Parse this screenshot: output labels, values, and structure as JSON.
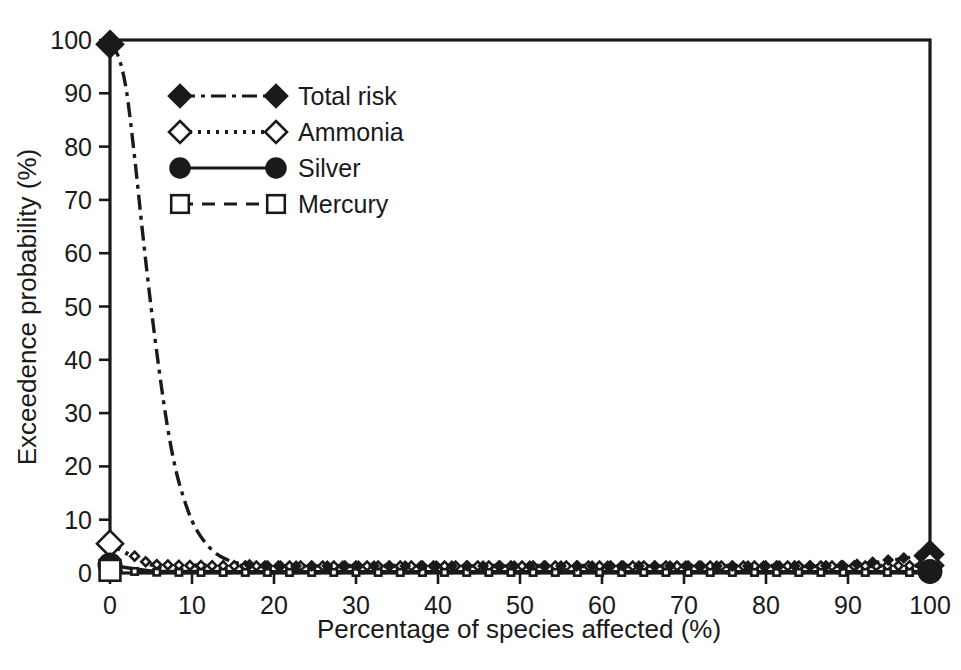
{
  "chart_data": {
    "type": "line",
    "title": "",
    "xlabel": "Percentage of species affected (%)",
    "ylabel": "Exceedence probability (%)",
    "xlim": [
      0,
      100
    ],
    "ylim": [
      0,
      100
    ],
    "xticks": [
      0,
      10,
      20,
      30,
      40,
      50,
      60,
      70,
      80,
      90,
      100
    ],
    "yticks": [
      0,
      10,
      20,
      30,
      40,
      50,
      60,
      70,
      80,
      90,
      100
    ],
    "xtick_labels": [
      "0",
      "10",
      "20",
      "30",
      "40",
      "50",
      "60",
      "70",
      "80",
      "90",
      "100"
    ],
    "ytick_labels": [
      "0",
      "10",
      "20",
      "30",
      "40",
      "50",
      "60",
      "70",
      "80",
      "90",
      "100"
    ],
    "grid": false,
    "legend_position": "upper-left-inside",
    "frame": "box",
    "series": [
      {
        "name": "Total risk",
        "marker": "filled-diamond",
        "linestyle": "dash-dot",
        "color": "#1a1a1a",
        "x": [
          0,
          1,
          2,
          3,
          4,
          5,
          6,
          7,
          8,
          9,
          10,
          11,
          12,
          13,
          14,
          15,
          16,
          18,
          20,
          25,
          30,
          40,
          50,
          60,
          70,
          80,
          90,
          100
        ],
        "y": [
          99.2,
          97.0,
          90.5,
          78.0,
          63.5,
          50.0,
          38.0,
          27.5,
          19.5,
          14.0,
          9.8,
          7.0,
          5.0,
          3.6,
          2.7,
          2.1,
          1.7,
          1.4,
          1.3,
          1.3,
          1.3,
          1.3,
          1.3,
          1.3,
          1.3,
          1.3,
          1.4,
          3.5
        ],
        "markers_at": [
          0,
          100
        ]
      },
      {
        "name": "Ammonia",
        "marker": "open-diamond",
        "linestyle": "dotted",
        "color": "#1a1a1a",
        "x": [
          0,
          5,
          10,
          20,
          30,
          40,
          50,
          60,
          70,
          80,
          90,
          100
        ],
        "y": [
          5.5,
          1.6,
          1.4,
          1.3,
          1.3,
          1.3,
          1.3,
          1.3,
          1.3,
          1.3,
          1.3,
          1.4
        ],
        "markers_at": [
          0,
          100
        ]
      },
      {
        "name": "Silver",
        "marker": "filled-circle",
        "linestyle": "solid",
        "color": "#1a1a1a",
        "x": [
          0,
          5,
          10,
          20,
          30,
          40,
          50,
          60,
          70,
          80,
          90,
          100
        ],
        "y": [
          1.5,
          0.4,
          0.3,
          0.25,
          0.25,
          0.25,
          0.25,
          0.25,
          0.25,
          0.25,
          0.25,
          0.3
        ],
        "markers_at": [
          0,
          100
        ]
      },
      {
        "name": "Mercury",
        "marker": "open-square",
        "linestyle": "dashed",
        "color": "#1a1a1a",
        "x": [
          0,
          5,
          10,
          20,
          30,
          40,
          50,
          60,
          70,
          80,
          90,
          100
        ],
        "y": [
          0.5,
          0.15,
          0.1,
          0.1,
          0.1,
          0.1,
          0.1,
          0.1,
          0.1,
          0.1,
          0.1,
          0.1
        ],
        "markers_at": [
          0
        ]
      }
    ]
  },
  "legend": {
    "entries": [
      {
        "label": "Total risk"
      },
      {
        "label": "Ammonia"
      },
      {
        "label": "Silver"
      },
      {
        "label": "Mercury"
      }
    ]
  },
  "axes": {
    "x_title": "Percentage of species affected (%)",
    "y_title": "Exceedence probability (%)"
  },
  "colors": {
    "ink": "#1a1a1a",
    "background": "#ffffff"
  }
}
